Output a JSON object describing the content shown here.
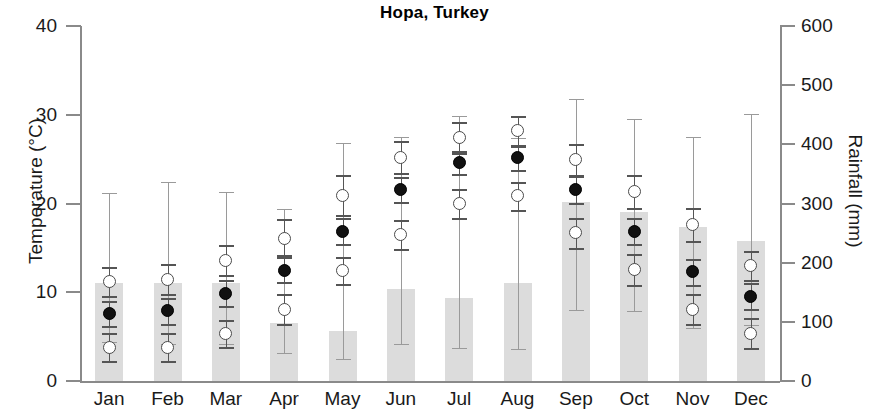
{
  "chart_data": {
    "type": "bar",
    "title": "Hopa, Turkey",
    "xlabel": "",
    "ylabel": "Temperature (°C)",
    "y2label": "Rainfall (mm)",
    "grid": false,
    "legend": "none",
    "categories": [
      "Jan",
      "Feb",
      "Mar",
      "Apr",
      "May",
      "Jun",
      "Jul",
      "Aug",
      "Sep",
      "Oct",
      "Nov",
      "Dec"
    ],
    "ylim": [
      0,
      40
    ],
    "y2lim": [
      0,
      600
    ],
    "yticks": [
      0,
      10,
      20,
      30,
      40
    ],
    "y2ticks": [
      0,
      100,
      200,
      300,
      400,
      500,
      600
    ],
    "series": [
      {
        "name": "Rainfall",
        "axis": "right",
        "units": "mm",
        "render": "bar",
        "values": [
          166,
          165,
          166,
          98,
          85,
          156,
          141,
          166,
          303,
          286,
          261,
          237
        ],
        "error_low": [
          66,
          62,
          63,
          48,
          38,
          63,
          55,
          54,
          120,
          118,
          90,
          95
        ],
        "error_high": [
          318,
          336,
          319,
          290,
          402,
          412,
          448,
          410,
          476,
          442,
          412,
          452
        ]
      },
      {
        "name": "Maximum temperature",
        "axis": "left",
        "units": "°C",
        "render": "open-circle",
        "values": [
          11.2,
          11.4,
          13.6,
          16.1,
          20.9,
          25.2,
          27.4,
          28.2,
          25.0,
          21.4,
          17.6,
          13.0
        ],
        "error_low": [
          9.6,
          9.8,
          11.9,
          14.2,
          18.7,
          23.4,
          25.7,
          26.5,
          23.2,
          19.5,
          15.8,
          11.4
        ],
        "error_high": [
          12.9,
          13.2,
          15.3,
          18.3,
          23.2,
          27.0,
          29.2,
          29.9,
          26.7,
          23.2,
          19.5,
          14.7
        ]
      },
      {
        "name": "Mean temperature",
        "axis": "left",
        "units": "°C",
        "render": "filled-circle",
        "values": [
          7.6,
          7.9,
          9.9,
          12.5,
          16.9,
          21.6,
          24.6,
          25.2,
          21.6,
          16.9,
          12.3,
          9.5
        ],
        "error_low": [
          6.2,
          6.4,
          8.5,
          11.1,
          15.4,
          20.2,
          23.3,
          23.8,
          20.1,
          15.4,
          10.8,
          8.1
        ],
        "error_high": [
          9.0,
          9.4,
          11.4,
          14.0,
          18.4,
          23.0,
          25.9,
          26.6,
          23.1,
          18.4,
          13.8,
          11.0
        ]
      },
      {
        "name": "Minimum temperature",
        "axis": "left",
        "units": "°C",
        "render": "open-circle",
        "values": [
          3.8,
          3.8,
          5.3,
          8.1,
          12.4,
          16.5,
          20.0,
          20.9,
          16.7,
          12.6,
          8.1,
          5.4
        ],
        "error_low": [
          2.2,
          2.2,
          3.8,
          6.4,
          10.9,
          14.9,
          18.4,
          19.3,
          15.0,
          10.8,
          6.4,
          3.7
        ],
        "error_high": [
          5.4,
          5.4,
          6.9,
          9.8,
          14.0,
          18.1,
          21.6,
          22.4,
          18.4,
          14.3,
          9.8,
          7.1
        ]
      }
    ]
  },
  "colors": {
    "bar_fill": "#dcdcdc",
    "mean_marker": "#111111",
    "open_marker_edge": "#4a4a4a",
    "axis": "#8a8a8a",
    "text": "#1a1a1a"
  }
}
